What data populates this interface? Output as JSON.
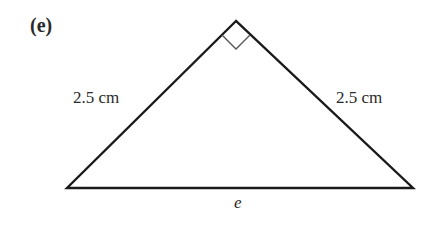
{
  "figure": {
    "part_label": "(e)",
    "shape": "right isosceles triangle",
    "sides": {
      "left": "2.5 cm",
      "right": "2.5 cm",
      "base": "e"
    },
    "right_angle_marker": "apex",
    "vertices": {
      "apex": [
        236,
        21
      ],
      "bottom_left": [
        67,
        188
      ],
      "bottom_right": [
        413,
        188
      ]
    },
    "colors": {
      "stroke": "#1a1a1a",
      "marker_stroke": "#555555",
      "background": "#ffffff"
    }
  }
}
